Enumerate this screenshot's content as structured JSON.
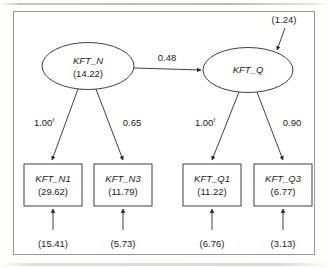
{
  "diagram": {
    "type": "path-diagram",
    "title": "",
    "frame_visible": true,
    "colors": {
      "stroke": "#2b2b2b",
      "frame": "#9a9a9a",
      "text": "#1b1b1b",
      "background": "#ffffff"
    },
    "latent_variables": [
      {
        "id": "KFT_N",
        "label": "KFT_N",
        "value": "(14.22)",
        "shape": "ellipse"
      },
      {
        "id": "KFT_Q",
        "label": "KFT_Q",
        "value": "",
        "shape": "ellipse"
      }
    ],
    "observed_variables": [
      {
        "id": "KFT_N1",
        "label": "KFT_N1",
        "value": "(29.62)",
        "shape": "rectangle",
        "residual": "(15.41)"
      },
      {
        "id": "KFT_N3",
        "label": "KFT_N3",
        "value": "(11.79)",
        "shape": "rectangle",
        "residual": "(5.73)"
      },
      {
        "id": "KFT_Q1",
        "label": "KFT_Q1",
        "value": "(11.22)",
        "shape": "rectangle",
        "residual": "(6.76)"
      },
      {
        "id": "KFT_Q3",
        "label": "KFT_Q3",
        "value": "(6.77)",
        "shape": "rectangle",
        "residual": "(3.13)"
      }
    ],
    "structural_paths": [
      {
        "from": "KFT_N",
        "to": "KFT_Q",
        "label": "0.48",
        "fixed": false
      }
    ],
    "loadings": [
      {
        "from": "KFT_N",
        "to": "KFT_N1",
        "label": "1.00",
        "fixed": true,
        "fixed_marker": "f"
      },
      {
        "from": "KFT_N",
        "to": "KFT_N3",
        "label": "0.65",
        "fixed": false,
        "fixed_marker": ""
      },
      {
        "from": "KFT_Q",
        "to": "KFT_Q1",
        "label": "1.00",
        "fixed": true,
        "fixed_marker": "f"
      },
      {
        "from": "KFT_Q",
        "to": "KFT_Q3",
        "label": "0.90",
        "fixed": false,
        "fixed_marker": ""
      }
    ],
    "disturbances": [
      {
        "target": "KFT_Q",
        "label": "(1.24)"
      }
    ]
  }
}
